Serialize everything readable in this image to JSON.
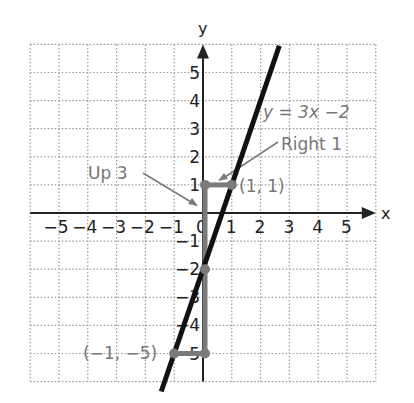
{
  "chart_data": {
    "type": "line",
    "title": "",
    "xlabel": "x",
    "ylabel": "y",
    "xlim": [
      -6,
      6
    ],
    "ylim": [
      -6,
      6
    ],
    "grid": true,
    "x_ticks": [
      "-5",
      "-4",
      "-3",
      "-2",
      "-1",
      "0",
      "1",
      "2",
      "3",
      "4",
      "5"
    ],
    "y_ticks": [
      "5",
      "4",
      "3",
      "2",
      "1",
      "-1",
      "-2",
      "-3",
      "-4",
      "-5"
    ],
    "series": [
      {
        "name": "y = 3x - 2",
        "equation": "y = 3x −2",
        "slope": 3,
        "intercept": -2,
        "x_range": [
          -1.45,
          2.65
        ]
      }
    ],
    "points": [
      {
        "label": "(1, 1)",
        "x": 1,
        "y": 1
      },
      {
        "label": "(−1, −5)",
        "x": -1,
        "y": -5
      },
      {
        "label": "",
        "x": 0,
        "y": -2
      },
      {
        "label": "",
        "x": 0,
        "y": 1
      },
      {
        "label": "",
        "x": 0,
        "y": -5
      }
    ],
    "annotations": [
      {
        "text": "Up 3",
        "from": [
          0,
          -2
        ],
        "to": [
          0,
          1
        ]
      },
      {
        "text": "Right 1",
        "from": [
          0,
          1
        ],
        "to": [
          1,
          1
        ]
      }
    ]
  },
  "labels": {
    "x_axis": "x",
    "y_axis": "y",
    "equation": "y = 3x −2",
    "up": "Up 3",
    "right": "Right 1",
    "point_a": "(1, 1)",
    "point_b": "(−1, −5)"
  },
  "colors": {
    "line": "#111111",
    "construction": "#7a7a7a",
    "grid": "#9a9a9a",
    "axis": "#222222",
    "annotation_text": "#777777"
  }
}
